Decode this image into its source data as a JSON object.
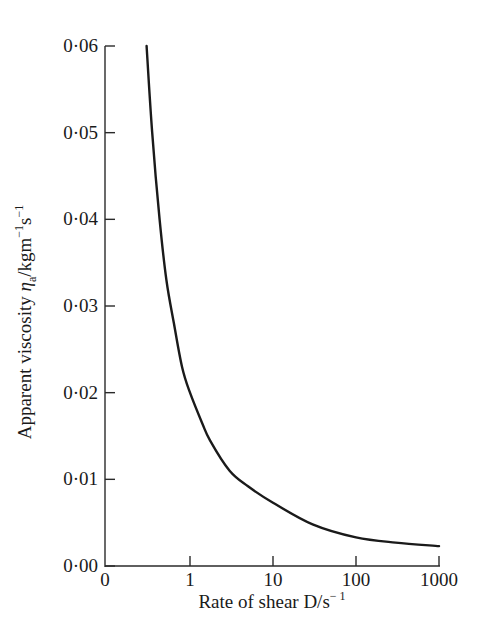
{
  "chart_data": {
    "type": "line",
    "title": "",
    "xlabel": "Rate of shear D/s⁻¹",
    "ylabel": "Apparent viscosity ηa/kgm⁻¹s⁻¹",
    "xscale": "log",
    "x_ticks": [
      "0",
      "1",
      "10",
      "100",
      "1000"
    ],
    "y_ticks": [
      "0·00",
      "0·01",
      "0·02",
      "0·03",
      "0·04",
      "0·05",
      "0·06"
    ],
    "ylim": [
      0,
      0.06
    ],
    "xlim": [
      0,
      1000
    ],
    "grid": false,
    "legend": null,
    "series": [
      {
        "name": "apparent viscosity",
        "x": [
          0.3,
          0.35,
          0.43,
          0.52,
          0.64,
          0.8,
          1.0,
          1.4,
          1.74,
          3.0,
          5.0,
          10,
          30,
          100,
          300,
          1000
        ],
        "y": [
          0.06,
          0.05,
          0.04,
          0.033,
          0.028,
          0.023,
          0.02,
          0.0165,
          0.0145,
          0.011,
          0.0092,
          0.0073,
          0.0048,
          0.0033,
          0.0027,
          0.0023
        ]
      }
    ]
  },
  "axes": {
    "x_title_main": "Rate of shear  D/s",
    "x_title_sup": "− 1",
    "y_title_main": "Apparent viscosity ",
    "y_title_eta": "η",
    "y_title_sub": "a",
    "y_title_unit": "/kgm",
    "y_title_sup1": "−1",
    "y_title_s": "s",
    "y_title_sup2": "−1"
  }
}
